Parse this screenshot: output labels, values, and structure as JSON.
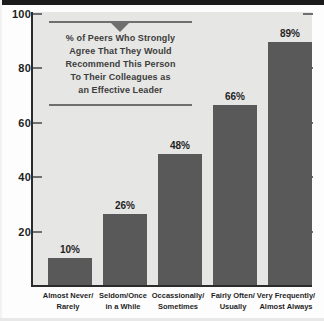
{
  "chart_data": {
    "type": "bar",
    "title": "",
    "subtitle": "",
    "xlabel": "",
    "ylabel": "",
    "ylim": [
      0,
      100
    ],
    "grid": false,
    "legend": "none",
    "categories": [
      "Almost Never/\nRarely",
      "Seldom/Once\nin a While",
      "Occassionally/\nSometimes",
      "Fairly Often/\nUsually",
      "Very Frequently/\nAlmost Always"
    ],
    "values": [
      10,
      26,
      48,
      66,
      89
    ],
    "value_labels": [
      "10%",
      "26%",
      "48%",
      "66%",
      "89%"
    ],
    "ytick_labels": [
      "100",
      "80",
      "60",
      "40",
      "20"
    ],
    "ytick_values": [
      100,
      80,
      60,
      40,
      20
    ],
    "bar_color": "#595959",
    "plot_background": "#e6e6e4",
    "axis_color": "#2b2b2b"
  },
  "categories_lines": [
    {
      "line1": "Almost Never/",
      "line2": "Rarely"
    },
    {
      "line1": "Seldom/Once",
      "line2": "in a While"
    },
    {
      "line1": "Occassionally/",
      "line2": "Sometimes"
    },
    {
      "line1": "Fairly Often/",
      "line2": "Usually"
    },
    {
      "line1": "Very Frequently/",
      "line2": "Almost Always"
    }
  ],
  "annotation": {
    "lines": [
      "% of Peers Who Strongly",
      "Agree That They Would",
      "Recommend This Person",
      "To Their Colleagues as",
      "an Effective Leader"
    ]
  }
}
